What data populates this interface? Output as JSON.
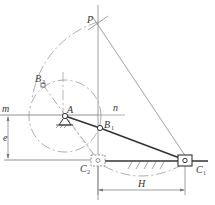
{
  "diagram": {
    "type": "offset slider-crank mechanism (graphical synthesis)",
    "labels": {
      "P": "P",
      "A": "A",
      "B1": "B",
      "B1_sub": "1",
      "B2": "B",
      "B2_sub": "2",
      "C1": "C",
      "C1_sub": "1",
      "C2": "C",
      "C2_sub": "2",
      "m": "m",
      "n": "n",
      "e": "e",
      "H": "H"
    },
    "colors": {
      "line": "#777777",
      "link": "#333333",
      "construction": "#999999"
    }
  }
}
